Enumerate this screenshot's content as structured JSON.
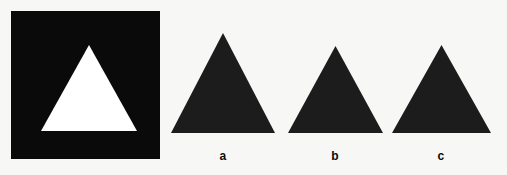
{
  "figure": {
    "background_color": "#f7f7f6",
    "ink_color": "#0a0a0a",
    "paper_color": "#ffffff",
    "panels": [
      {
        "id": "reversed-contrast-panel",
        "description": "black square containing a white upward triangle",
        "label": "",
        "square_fill": "#0a0a0a",
        "triangle_fill": "#ffffff",
        "triangle_orientation": "up"
      },
      {
        "id": "triangle-a",
        "description": "solid black upward triangle",
        "label": "a",
        "triangle_fill": "#1c1c1c",
        "triangle_orientation": "up"
      },
      {
        "id": "triangle-b",
        "description": "solid black upward triangle",
        "label": "b",
        "triangle_fill": "#1c1c1c",
        "triangle_orientation": "up"
      },
      {
        "id": "triangle-c",
        "description": "solid black upward triangle",
        "label": "c",
        "triangle_fill": "#1c1c1c",
        "triangle_orientation": "up"
      }
    ],
    "labels": {
      "a": "a",
      "b": "b",
      "c": "c"
    }
  }
}
